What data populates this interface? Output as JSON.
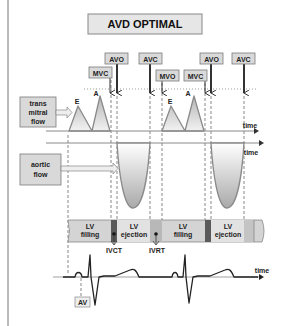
{
  "title": "AVD OPTIMAL",
  "event_labels": [
    {
      "text": "MVC",
      "x": 89,
      "y": 67,
      "arrow_x": 110
    },
    {
      "text": "AVO",
      "x": 105,
      "y": 53,
      "arrow_x": 117
    },
    {
      "text": "AVC",
      "x": 139,
      "y": 53,
      "arrow_x": 150
    },
    {
      "text": "MVO",
      "x": 156,
      "y": 70,
      "arrow_x": 162
    },
    {
      "text": "MVC",
      "x": 184,
      "y": 70,
      "arrow_x": 205
    },
    {
      "text": "AVO",
      "x": 200,
      "y": 53,
      "arrow_x": 211
    },
    {
      "text": "AVC",
      "x": 232,
      "y": 53,
      "arrow_x": 244
    }
  ],
  "transmitral": {
    "label_lines": [
      "trans",
      "mitral",
      "flow"
    ],
    "wave_labels": {
      "e1": "E",
      "a1": "A",
      "e2": "E",
      "a2": "A"
    },
    "axis_label": "time"
  },
  "aortic": {
    "label_lines": [
      "aortic",
      "flow"
    ],
    "axis_label": "time"
  },
  "lv_phases": [
    {
      "line1": "LV",
      "line2": "filling"
    },
    {
      "line1": "LV",
      "line2": "ejection"
    },
    {
      "line1": "LV",
      "line2": "filling"
    },
    {
      "line1": "LV",
      "line2": "ejection"
    }
  ],
  "intervals": {
    "ivct": "IVCT",
    "ivrt": "IVRT"
  },
  "ecg": {
    "axis_label": "time",
    "av_label": "AV"
  },
  "colors": {
    "label_box_fill": "#d9d9d9",
    "label_box_stroke": "#7a7a7a",
    "wave_stroke": "#8a8a8a",
    "lv_filling": "#d4d4d4",
    "lv_ejection": "#e2e2e2",
    "isovolumic_dark": "#5a5a5a",
    "isovolumic_light": "#b8b8b8"
  }
}
